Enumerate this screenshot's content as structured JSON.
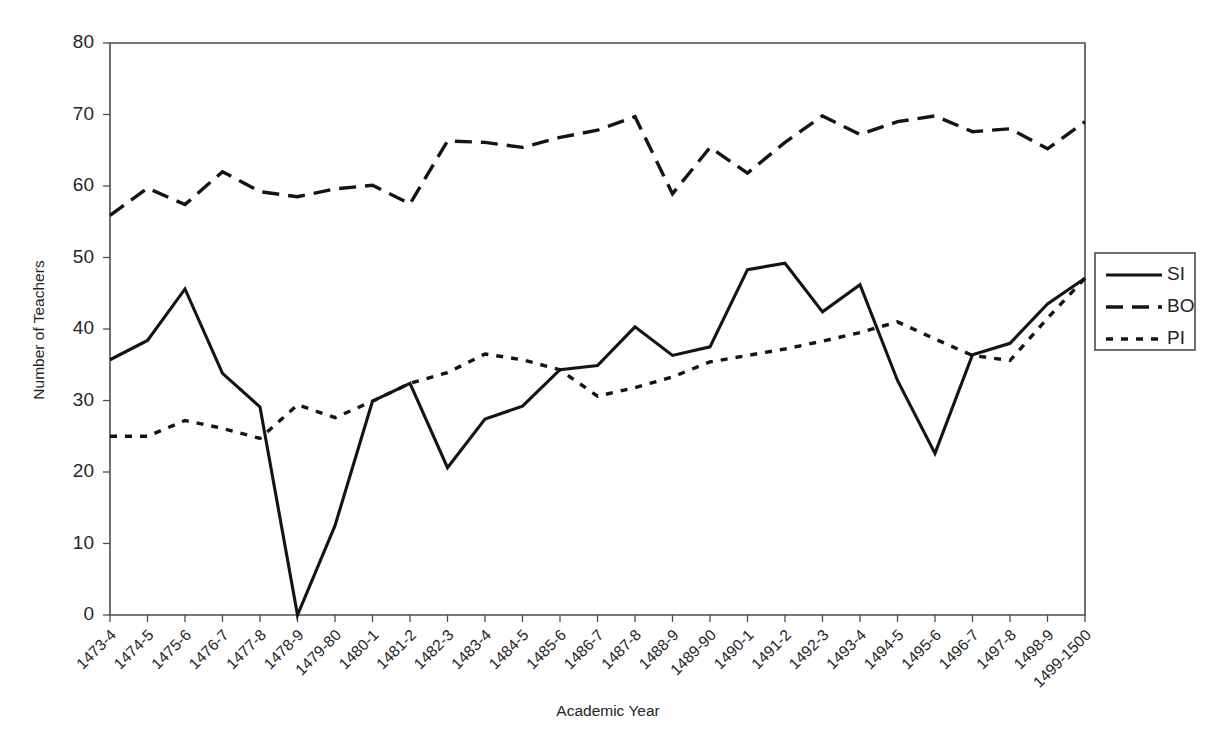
{
  "chart_data": {
    "type": "line",
    "title": "",
    "xlabel": "Academic Year",
    "ylabel": "Number of Teachers",
    "ylim": [
      0,
      80
    ],
    "yticks": [
      0,
      10,
      20,
      30,
      40,
      50,
      60,
      70,
      80
    ],
    "grid": false,
    "legend_position": "right",
    "categories": [
      "1473-4",
      "1474-5",
      "1475-6",
      "1476-7",
      "1477-8",
      "1478-9",
      "1479-80",
      "1480-1",
      "1481-2",
      "1482-3",
      "1483-4",
      "1484-5",
      "1485-6",
      "1486-7",
      "1487-8",
      "1488-9",
      "1489-90",
      "1490-1",
      "1491-2",
      "1492-3",
      "1493-4",
      "1494-5",
      "1495-6",
      "1496-7",
      "1497-8",
      "1498-9",
      "1499-1500"
    ],
    "series": [
      {
        "name": "SI",
        "style": "solid",
        "values": [
          35.7,
          38.4,
          45.6,
          33.8,
          29.1,
          0,
          12.5,
          29.9,
          32.4,
          20.6,
          27.4,
          29.2,
          34.3,
          34.9,
          40.3,
          36.3,
          37.5,
          48.3,
          49.2,
          42.4,
          46.2,
          32.8,
          22.6,
          36.4,
          38.0,
          43.5,
          47.1
        ]
      },
      {
        "name": "BO",
        "style": "dashed",
        "values": [
          55.9,
          59.7,
          57.4,
          62.0,
          59.2,
          58.5,
          59.6,
          60.1,
          57.5,
          66.3,
          66.1,
          65.4,
          66.8,
          67.8,
          69.7,
          58.9,
          65.4,
          61.8,
          66.1,
          69.8,
          67.2,
          69.0,
          69.8,
          67.6,
          68.0,
          65.2,
          69.0
        ]
      },
      {
        "name": "PI",
        "style": "dotted",
        "values": [
          25.0,
          25.0,
          27.2,
          26.1,
          24.7,
          29.4,
          27.6,
          29.9,
          32.4,
          33.9,
          36.5,
          35.7,
          34.3,
          30.6,
          31.8,
          33.3,
          35.4,
          36.3,
          37.2,
          38.3,
          39.5,
          41.0,
          38.6,
          36.3,
          35.6,
          41.5,
          47.1
        ]
      }
    ]
  },
  "legend": {
    "entries": [
      "SI",
      "BO",
      "PI"
    ]
  },
  "axes": {
    "y_tick_labels": [
      "80",
      "70",
      "60",
      "50",
      "40",
      "30",
      "20",
      "10",
      "0"
    ],
    "y_axis_title": "Number of Teachers",
    "x_axis_title": "Academic Year"
  }
}
